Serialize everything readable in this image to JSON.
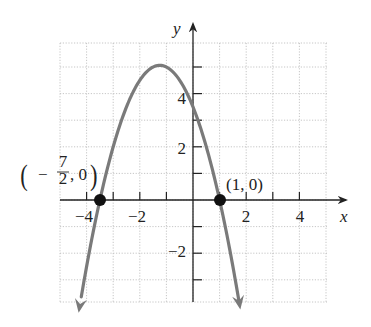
{
  "chart_data": {
    "type": "line",
    "title": "",
    "xlabel": "x",
    "ylabel": "y",
    "xlim": [
      -5,
      5
    ],
    "ylim": [
      -4,
      6
    ],
    "grid": true,
    "x_ticks": [
      -4,
      -2,
      2,
      4
    ],
    "x_tick_labels": [
      "−4",
      "−2",
      "2",
      "4"
    ],
    "y_ticks": [
      -2,
      2,
      4
    ],
    "y_tick_labels": [
      "−2",
      "2",
      "4"
    ],
    "series": [
      {
        "name": "parabola",
        "equation": "y = -(x + 7/2)(x - 1)",
        "color": "#7a7a7a",
        "x": [
          -4.3,
          -3.5,
          -3,
          -2,
          -1.25,
          0,
          1,
          1.5,
          1.8
        ],
        "y": [
          -3.84,
          0,
          2,
          4.5,
          5.06,
          3.5,
          0,
          -2.25,
          -4.24
        ]
      }
    ],
    "points": [
      {
        "x": -3.5,
        "y": 0,
        "label_parts": [
          "−",
          "7",
          "2",
          ", 0"
        ],
        "label": "(−7/2, 0)"
      },
      {
        "x": 1,
        "y": 0,
        "label": "(1, 0)"
      }
    ]
  },
  "labels": {
    "x_axis": "x",
    "y_axis": "y",
    "point1_frac_num": "7",
    "point1_frac_den": "2",
    "point1_minus": "−",
    "point1_rest": ", 0",
    "point2": "(1, 0)",
    "tick_x_m4": "−4",
    "tick_x_m2": "−2",
    "tick_x_2": "2",
    "tick_x_4": "4",
    "tick_y_2": "2",
    "tick_y_4": "4",
    "tick_y_m2": "−2"
  }
}
